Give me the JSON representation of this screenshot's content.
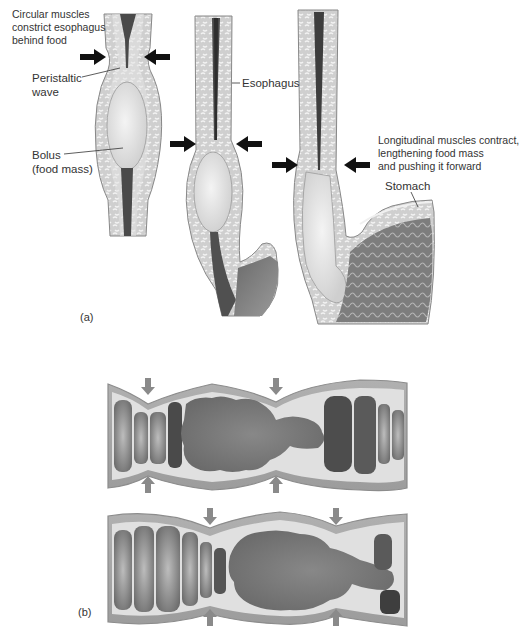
{
  "figure": {
    "part_a": {
      "label": "(a)",
      "annotations": {
        "circular_muscles": "Circular muscles\nconstrict esophagus\nbehind food",
        "peristaltic_wave": "Peristaltic\nwave",
        "bolus": "Bolus\n(food mass)",
        "esophagus": "Esophagus",
        "longitudinal_muscles": "Longitudinal muscles contract,\nlengthening food mass\nand pushing it forward",
        "stomach": "Stomach"
      },
      "stages": [
        "stage-1-bolus-upper",
        "stage-2-bolus-middle",
        "stage-3-bolus-entering-stomach"
      ]
    },
    "part_b": {
      "label": "(b)",
      "panels": [
        "segmentation-top",
        "segmentation-bottom"
      ]
    },
    "colors": {
      "arrow_black": "#111111",
      "arrow_grey": "#8a8a8a",
      "tissue_light": "#d9d9d9",
      "tissue_mid": "#a8a8a8",
      "lumen_dark": "#555555",
      "bolus": "#e6e6e6",
      "chyme": "#7a7a7a"
    }
  }
}
